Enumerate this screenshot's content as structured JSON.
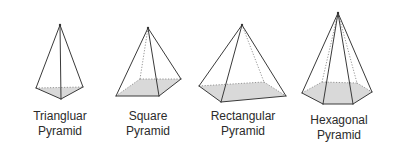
{
  "diagram": {
    "background": "#ffffff",
    "line_color": "#3a3a3a",
    "base_fill": "#d9d9d9",
    "pyramids": [
      {
        "id": "triangular",
        "label_line1": "Triangluar",
        "label_line2": "Pyramid"
      },
      {
        "id": "square",
        "label_line1": "Square",
        "label_line2": "Pyramid"
      },
      {
        "id": "rectangular",
        "label_line1": "Rectangular",
        "label_line2": "Pyramid"
      },
      {
        "id": "hexagonal",
        "label_line1": "Hexagonal",
        "label_line2": "Pyramid"
      }
    ]
  }
}
